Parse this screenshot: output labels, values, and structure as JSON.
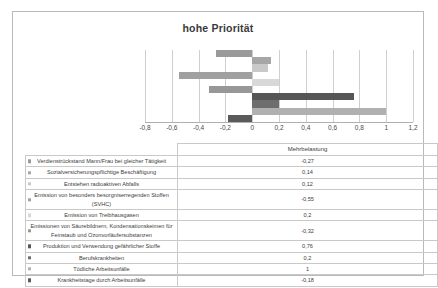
{
  "chart_data": {
    "type": "bar",
    "orientation": "horizontal",
    "title": "hohe Priorität",
    "xlabel": "",
    "ylabel": "",
    "xlim": [
      -0.8,
      1.2
    ],
    "xticks": [
      "-0,8",
      "-0,6",
      "-0,4",
      "-0,2",
      "0",
      "0,2",
      "0,4",
      "0,6",
      "0,8",
      "1",
      "1,2"
    ],
    "xtick_values": [
      -0.8,
      -0.6,
      -0.4,
      -0.2,
      0,
      0.2,
      0.4,
      0.6,
      0.8,
      1.0,
      1.2
    ],
    "grid": true,
    "legend": false,
    "series_name": "Mehrbelastung",
    "categories": [
      "Verdienstrückstand Mann/Frau bei gleicher Tätigkeit",
      "Sozialversicherungspflichtige Beschäftigung",
      "Entstehen radioaktiven Abfalls",
      "Emission von besonders besorgniserregenden Stoffen (SVHC)",
      "Emission von Treibhausgasen",
      "Emissionen von Säurebildnern, Kondensationskeimen für Feinstaub und Ozonvorläufersubstanzen",
      "Produktion und Verwendung gefährlicher Stoffe",
      "Berufskrankheiten",
      "Tödliche Arbeitsunfälle",
      "Krankheitstage durch Arbeitsunfälle"
    ],
    "values": [
      -0.27,
      0.14,
      0.12,
      -0.55,
      0.2,
      -0.32,
      0.76,
      0.2,
      1,
      -0.18
    ],
    "value_labels": [
      "-0,27",
      "0,14",
      "0,12",
      "-0,55",
      "0,2",
      "-0,32",
      "0,76",
      "0,2",
      "1",
      "-0,18"
    ],
    "bar_colors": [
      "#9a9a9a",
      "#a6a6a6",
      "#c9c9c9",
      "#a0a0a0",
      "#d8d8d8",
      "#979797",
      "#565656",
      "#6e6e6e",
      "#b0b0b0",
      "#5a5a5a"
    ]
  },
  "table": {
    "header_value": "Mehrbelastung",
    "rows": [
      {
        "label": "Verdienstrückstand Mann/Frau bei gleicher Tätigkeit",
        "value": "-0,27"
      },
      {
        "label": "Sozialversicherungspflichtige Beschäftigung",
        "value": "0,14"
      },
      {
        "label": "Entstehen radioaktiven Abfalls",
        "value": "0,12"
      },
      {
        "label": "Emission von besonders besorgniserregenden Stoffen (SVHC)",
        "value": "-0,55"
      },
      {
        "label": "Emission von Treibhausgasen",
        "value": "0,2"
      },
      {
        "label": "Emissionen von Säurebildnern, Kondensationskeimen für Feinstaub und Ozonvorläufersubstanzen",
        "value": "-0,32"
      },
      {
        "label": "Produktion und Verwendung gefährlicher Stoffe",
        "value": "0,76"
      },
      {
        "label": "Berufskrankheiten",
        "value": "0,2"
      },
      {
        "label": "Tödliche Arbeitsunfälle",
        "value": "1"
      },
      {
        "label": "Krankheitstage durch Arbeitsunfälle",
        "value": "-0,18"
      }
    ]
  },
  "colors": {
    "frame_border": "#b9b9b9",
    "gridline": "#cfcfcf",
    "axis": "#b0b0b0",
    "text": "#3d3d3d",
    "background": "#ffffff"
  }
}
